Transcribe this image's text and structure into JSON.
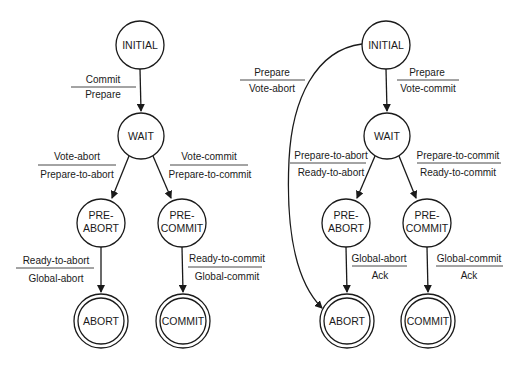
{
  "diagrams": [
    {
      "name": "coordinator",
      "states": {
        "initial": {
          "label": "INITIAL",
          "x": 140,
          "y": 45
        },
        "wait": {
          "label": "WAIT",
          "x": 141,
          "y": 136
        },
        "pre_abort": {
          "line1": "PRE-",
          "line2": "ABORT",
          "x": 101,
          "y": 223
        },
        "pre_commit": {
          "line1": "PRE-",
          "line2": "COMMIT",
          "x": 182,
          "y": 223
        },
        "abort": {
          "label": "ABORT",
          "x": 101,
          "y": 321
        },
        "commit": {
          "label": "COMMIT",
          "x": 183,
          "y": 321
        }
      },
      "transitions": {
        "initial_wait": {
          "top": "Commit",
          "bottom": "Prepare"
        },
        "wait_pre_abort": {
          "top": "Vote-abort",
          "bottom": "Prepare-to-abort"
        },
        "wait_pre_commit": {
          "top": "Vote-commit",
          "bottom": "Prepare-to-commit"
        },
        "pre_abort_abort": {
          "top": "Ready-to-abort",
          "bottom": "Global-abort"
        },
        "pre_commit_commit": {
          "top": "Ready-to-commit",
          "bottom": "Global-commit"
        }
      }
    },
    {
      "name": "participant",
      "states": {
        "initial": {
          "label": "INITIAL",
          "x": 386,
          "y": 45
        },
        "wait": {
          "label": "WAIT",
          "x": 387,
          "y": 136
        },
        "pre_abort": {
          "line1": "PRE-",
          "line2": "ABORT",
          "x": 346,
          "y": 223
        },
        "pre_commit": {
          "line1": "PRE-",
          "line2": "COMMIT",
          "x": 427,
          "y": 223
        },
        "abort": {
          "label": "ABORT",
          "x": 347,
          "y": 321
        },
        "commit": {
          "label": "COMMIT",
          "x": 428,
          "y": 321
        }
      },
      "transitions": {
        "initial_abort": {
          "top": "Prepare",
          "bottom": "Vote-abort"
        },
        "initial_wait": {
          "top": "Prepare",
          "bottom": "Vote-commit"
        },
        "wait_pre_abort": {
          "top": "Prepare-to-abort",
          "bottom": "Ready-to-abort"
        },
        "wait_pre_commit": {
          "top": "Prepare-to-commit",
          "bottom": "Ready-to-commit"
        },
        "pre_abort_abort": {
          "top": "Global-abort",
          "bottom": "Ack"
        },
        "pre_commit_commit": {
          "top": "Global-commit",
          "bottom": "Ack"
        }
      }
    }
  ]
}
